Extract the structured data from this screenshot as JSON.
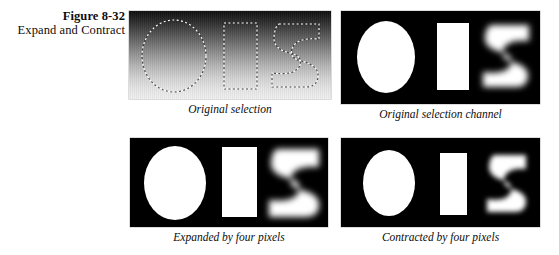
{
  "figure": {
    "number": "Figure 8-32",
    "title": "Expand and Contract"
  },
  "panels": [
    {
      "id": "original-selection",
      "caption": "Original selection",
      "kind": "gradient-with-selection-outlines",
      "background": "vertical gradient dark-to-light",
      "shapes": [
        "ellipse",
        "rectangle",
        "swirl"
      ],
      "outline_style": "dashed marching ants"
    },
    {
      "id": "original-selection-channel",
      "caption": "Original selection channel",
      "kind": "alpha-channel-mask",
      "background": "#000000",
      "shape_color": "#ffffff",
      "shapes": [
        "ellipse",
        "rectangle",
        "swirl"
      ],
      "swirl_edge": "soft"
    },
    {
      "id": "expanded-four-pixels",
      "caption": "Expanded by four pixels",
      "kind": "alpha-channel-mask",
      "background": "#000000",
      "shape_color": "#ffffff",
      "shapes": [
        "ellipse",
        "rectangle",
        "swirl"
      ],
      "swirl_edge": "soft"
    },
    {
      "id": "contracted-four-pixels",
      "caption": "Contracted by four pixels",
      "kind": "alpha-channel-mask",
      "background": "#000000",
      "shape_color": "#ffffff",
      "shapes": [
        "ellipse",
        "rectangle",
        "swirl"
      ],
      "swirl_edge": "soft"
    }
  ],
  "colors": {
    "page_background": "#ffffff",
    "mask_background": "#000000",
    "mask_foreground": "#ffffff",
    "text": "#0d0d0d"
  }
}
